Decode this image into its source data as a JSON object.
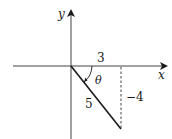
{
  "diagram": {
    "type": "reference-angle-diagram",
    "axes": {
      "x_label": "x",
      "y_label": "y"
    },
    "labels": {
      "adjacent": "3",
      "opposite": "−4",
      "hypotenuse": "5",
      "angle": "θ"
    },
    "colors": {
      "line": "#1a1a1a",
      "axis": "#444444",
      "background": "#ffffff"
    }
  }
}
